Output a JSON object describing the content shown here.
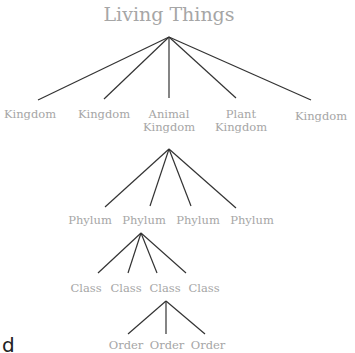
{
  "title": "Living Things",
  "line_color": "#333333",
  "label_color": "#a6a6a6",
  "levels": {
    "kingdoms": [
      {
        "line1": "Kingdom",
        "line2": ""
      },
      {
        "line1": "Kingdom",
        "line2": ""
      },
      {
        "line1": "Animal",
        "line2": "Kingdom"
      },
      {
        "line1": "Plant",
        "line2": "Kingdom"
      },
      {
        "line1": "Kingdom",
        "line2": ""
      }
    ],
    "phyla": [
      "Phylum",
      "Phylum",
      "Phylum",
      "Phylum"
    ],
    "classes": [
      "Class",
      "Class",
      "Class",
      "Class"
    ],
    "orders": [
      "Order",
      "Order",
      "Order"
    ]
  },
  "stray_text": "d"
}
